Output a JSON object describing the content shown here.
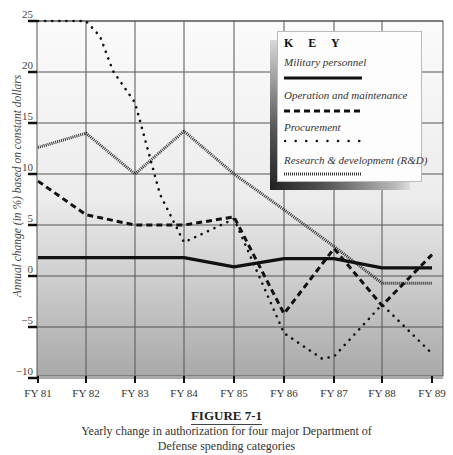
{
  "chart_data": {
    "type": "line",
    "title": "",
    "xlabel": "",
    "ylabel": "Annual change (in %) based on constant dollars",
    "ylim": [
      -10,
      25
    ],
    "yticks": [
      25,
      20,
      15,
      10,
      5,
      0,
      -5,
      -10
    ],
    "grid": true,
    "legend_position": "upper right",
    "legend_title": "K E Y",
    "categories": [
      "FY 81",
      "FY 82",
      "FY 83",
      "FY 84",
      "FY 85",
      "FY 86",
      "FY 87",
      "FY 88",
      "FY 89"
    ],
    "series": [
      {
        "name": "Military personnel",
        "style": "solid",
        "values": [
          1.8,
          1.8,
          1.8,
          1.8,
          0.9,
          1.7,
          1.7,
          0.8,
          0.8
        ]
      },
      {
        "name": "Operation and maintenance",
        "style": "dashed",
        "values": [
          9.3,
          6.0,
          5.0,
          5.0,
          5.8,
          -3.7,
          2.7,
          -2.9,
          2.1
        ]
      },
      {
        "name": "Procurement",
        "style": "dotted",
        "values": [
          25.0,
          25.0,
          17.0,
          3.3,
          5.6,
          -5.6,
          -7.9,
          -2.8,
          -7.6
        ]
      },
      {
        "name": "Research & development (R&D)",
        "style": "fine-dotted",
        "values": [
          12.6,
          14.0,
          10.0,
          14.2,
          10.0,
          6.5,
          2.9,
          -0.7,
          -0.7
        ]
      }
    ]
  },
  "figure": {
    "label": "FIGURE 7-1",
    "caption_line1": "Yearly change in authorization for four major Department of",
    "caption_line2": "Defense spending categories"
  }
}
